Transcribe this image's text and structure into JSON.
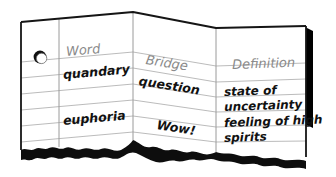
{
  "document": {
    "kind": "folded-paper-vocabulary-chart",
    "panels": 3,
    "hole_punch": "hole-punch-circle",
    "bottom_edge": "torn-edge",
    "colors": {
      "paper": "#ffffff",
      "rule_line": "#b3b3b3",
      "fold_line": "#1a1a1a",
      "header_text": "#8a8a8a",
      "entry_text": "#111111",
      "shadow": "#000000"
    }
  },
  "headers": {
    "word": "Word",
    "bridge": "Bridge",
    "definition": "Definition"
  },
  "rows": [
    {
      "word": "quandary",
      "bridge": "question",
      "definition_line1": "state of",
      "definition_line2": "uncertainty"
    },
    {
      "word": "euphoria",
      "bridge": "Wow!",
      "definition_line1": "feeling of high",
      "definition_line2": "spirits"
    }
  ]
}
